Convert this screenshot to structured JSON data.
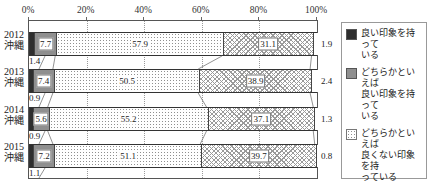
{
  "chart_data": {
    "type": "bar",
    "subtype": "stacked-horizontal-percent",
    "title": "",
    "axis": {
      "ticks": [
        "0%",
        "20%",
        "40%",
        "60%",
        "80%",
        "100%"
      ],
      "tick_values": [
        0,
        20,
        40,
        60,
        80,
        100
      ],
      "range": [
        0,
        100
      ],
      "grid": true
    },
    "legend_position": "right",
    "series": [
      {
        "name": "良い印象を持っている",
        "legend_lines": [
          "良い印象を持って",
          "いる"
        ],
        "pattern": "solid-dark",
        "color": "#2e2e2e",
        "value_label_style": "below-left"
      },
      {
        "name": "どちらかといえば良い印象を持っている",
        "legend_lines": [
          "どちらかといえば",
          "良い印象を持って",
          "いる"
        ],
        "pattern": "solid-gray",
        "color": "#8f8f8f",
        "value_label_style": "boxed"
      },
      {
        "name": "どちらかといえば良くない印象を持っている",
        "legend_lines": [
          "どちらかといえば",
          "良くない印象を持",
          "っている"
        ],
        "pattern": "dots",
        "color": "#ffffff",
        "value_label_style": "plain"
      },
      {
        "name": "良くない印象を持っている",
        "legend_lines": [
          "良くない印象を",
          "持っている"
        ],
        "pattern": "crosshatch",
        "color": "#ffffff",
        "value_label_style": "boxed"
      },
      {
        "name": "無回答",
        "legend_lines": [
          "無回答"
        ],
        "pattern": "plain",
        "color": "#ffffff",
        "value_label_style": "outside-right"
      }
    ],
    "rows": [
      {
        "label_lines": [
          "2012",
          "沖縄"
        ],
        "values": [
          1.4,
          7.7,
          57.9,
          31.1,
          1.9
        ]
      },
      {
        "label_lines": [
          "2013",
          "沖縄"
        ],
        "values": [
          0.9,
          7.4,
          50.5,
          38.9,
          2.4
        ]
      },
      {
        "label_lines": [
          "2014",
          "沖縄"
        ],
        "values": [
          0.9,
          5.6,
          55.2,
          37.1,
          1.3
        ]
      },
      {
        "label_lines": [
          "2015",
          "沖縄"
        ],
        "values": [
          1.1,
          7.2,
          51.1,
          39.7,
          0.8
        ]
      }
    ]
  }
}
